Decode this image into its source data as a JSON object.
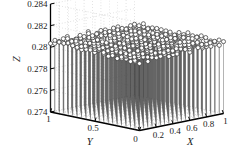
{
  "figure": {
    "background_color": "#ffffff",
    "axis_color": "#000000",
    "grid_color": "#9a9a9a",
    "marker_edge_color": "#3c3c3c",
    "marker_face_color": "#ffffff",
    "stem_color": "#4a4a4a",
    "width": 246,
    "height": 168
  },
  "chart_data": {
    "type": "scatter",
    "title": "",
    "xlabel": "X",
    "ylabel": "Y",
    "zlabel": "Z",
    "projection": "3d",
    "style": "stem3",
    "grid": true,
    "legend": null,
    "xlim": [
      0,
      1
    ],
    "ylim": [
      0,
      1
    ],
    "zlim": [
      0.274,
      0.284
    ],
    "xticks": [
      "0",
      "0.2",
      "0.4",
      "0.6",
      "0.8",
      "1"
    ],
    "xtick_values": [
      0,
      0.2,
      0.4,
      0.6,
      0.8,
      1
    ],
    "yticks": [
      "0",
      "0.5",
      "1"
    ],
    "ytick_values": [
      0,
      0.5,
      1
    ],
    "zticks": [
      "0.274",
      "0.276",
      "0.278",
      "0.28",
      "0.282",
      "0.284"
    ],
    "ztick_values": [
      0.274,
      0.276,
      0.278,
      0.28,
      0.282,
      0.284
    ],
    "grid_nx": 21,
    "grid_ny": 21,
    "z_mean": 0.2805,
    "z_note": "near-flat surface of markers at approximately 0.2805 across the full X-Y grid",
    "points_summary": {
      "x_range": [
        0,
        1
      ],
      "y_range": [
        0,
        1
      ],
      "z_range": [
        0.2802,
        0.2808
      ]
    },
    "series": [
      {
        "name": "Z(X,Y)",
        "marker": "o",
        "values_constant": 0.2805
      }
    ]
  },
  "labels": {
    "z_axis": "Z",
    "y_axis": "Y",
    "x_axis": "X"
  }
}
